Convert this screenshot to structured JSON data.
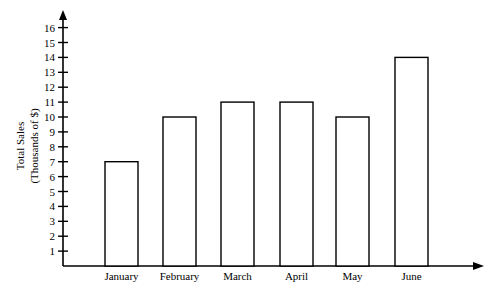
{
  "chart_data": {
    "type": "bar",
    "title": "",
    "xlabel": "",
    "ylabel": "Total Sales",
    "ylabel_line2": "(Thousands of $)",
    "categories": [
      "January",
      "February",
      "March",
      "April",
      "May",
      "June"
    ],
    "values": [
      7,
      10,
      11,
      11,
      10,
      14
    ],
    "ylim": [
      0,
      16
    ],
    "yticks": [
      1,
      2,
      3,
      4,
      5,
      6,
      7,
      8,
      9,
      10,
      11,
      12,
      13,
      14,
      15,
      16
    ],
    "grid": false,
    "legend": null,
    "bar_fill": "#ffffff",
    "bar_stroke": "#000000"
  }
}
